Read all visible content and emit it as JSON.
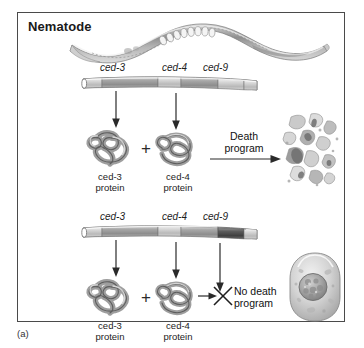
{
  "figure": {
    "caption_label": "(a)",
    "panel_title": "Nematode",
    "organism_icon": "nematode-worm-illustration",
    "border_color": "#4a4a4a",
    "background_color": "#ffffff"
  },
  "panels": [
    {
      "id": "wild-type-death-pathway",
      "chromosome": {
        "icon": "chromosome-bar",
        "genes": [
          {
            "name": "ced-3",
            "state": "active",
            "shade": "#9c9c9c"
          },
          {
            "name": "ced-4",
            "state": "active",
            "shade": "#a3a3a3"
          },
          {
            "name": "ced-9",
            "state": "inactive",
            "shade": "#b4b4b4"
          }
        ]
      },
      "arrows": [
        {
          "from": "ced-3",
          "to": "ced-3 protein",
          "direction": "down"
        },
        {
          "from": "ced-4",
          "to": "ced-4 protein",
          "direction": "down"
        }
      ],
      "proteins": [
        {
          "name": "ced-3",
          "label_line1": "ced-3",
          "label_line2": "protein",
          "icon": "folded-protein-ribbon"
        },
        {
          "name": "ced-4",
          "label_line1": "ced-4",
          "label_line2": "protein",
          "icon": "folded-protein-ribbon"
        }
      ],
      "operator": "+",
      "outcome": {
        "label_line1": "Death",
        "label_line2": "program",
        "arrow": "right-arrow",
        "result_icon": "apoptotic-cell-debris",
        "blocked": false
      }
    },
    {
      "id": "ced-9-active-survival-pathway",
      "chromosome": {
        "icon": "chromosome-bar",
        "genes": [
          {
            "name": "ced-3",
            "state": "active",
            "shade": "#9c9c9c"
          },
          {
            "name": "ced-4",
            "state": "active",
            "shade": "#a3a3a3"
          },
          {
            "name": "ced-9",
            "state": "active",
            "shade": "#5d5d5d"
          }
        ]
      },
      "arrows": [
        {
          "from": "ced-3",
          "to": "ced-3 protein",
          "direction": "down"
        },
        {
          "from": "ced-4",
          "to": "ced-4 protein",
          "direction": "down"
        },
        {
          "from": "ced-9",
          "to": "block-x",
          "direction": "down"
        }
      ],
      "proteins": [
        {
          "name": "ced-3",
          "label_line1": "ced-3",
          "label_line2": "protein",
          "icon": "folded-protein-ribbon"
        },
        {
          "name": "ced-4",
          "label_line1": "ced-4",
          "label_line2": "protein",
          "icon": "folded-protein-ribbon"
        }
      ],
      "operator": "+",
      "outcome": {
        "label_line1": "No death",
        "label_line2": "program",
        "arrow": "right-arrow-blocked",
        "block_marker": "x-cross",
        "result_icon": "healthy-living-cell",
        "blocked": true
      }
    }
  ]
}
